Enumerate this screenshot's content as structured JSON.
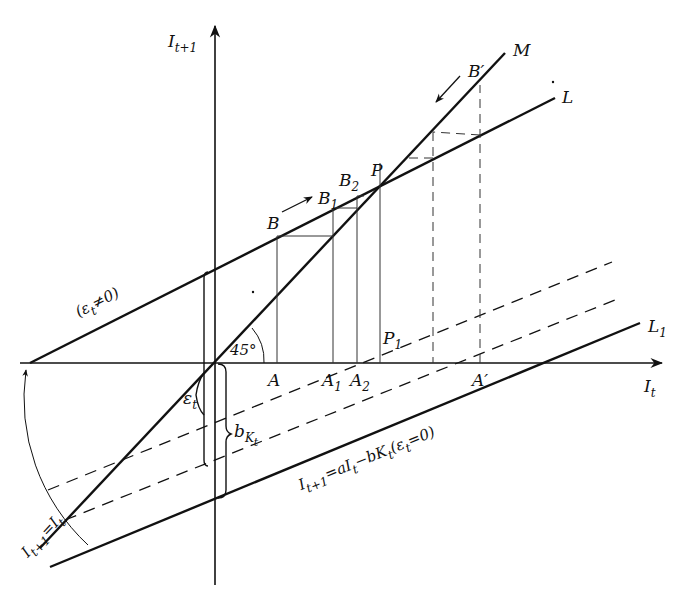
{
  "figure": {
    "type": "cobweb-diagram",
    "axes": {
      "y_label": "I",
      "y_label_sub": "t+1",
      "x_label": "I",
      "x_label_sub": "t"
    },
    "lines": {
      "M": "M",
      "L": "L",
      "L1": "L",
      "L1_sub": "1"
    },
    "points": {
      "B": "B",
      "B1": "B",
      "B1_sub": "1",
      "B2": "B",
      "B2_sub": "2",
      "P": "P",
      "B_prime": "B′",
      "A": "A",
      "A1": "A",
      "A1_sub": "1",
      "A2": "A",
      "A2_sub": "2",
      "A_prime": "A′",
      "P1": "P",
      "P1_sub": "1"
    },
    "annotations": {
      "angle": "45°",
      "epsilon_nonzero": "(ε",
      "epsilon_nonzero_sub": "t",
      "epsilon_nonzero_rest": "≠0)",
      "epsilon_t": "ε",
      "epsilon_t_sub": "t",
      "b_k": "b",
      "b_k_sub": "K",
      "b_k_subsub": "t",
      "equation": "I",
      "equation_sub1": "t+1",
      "equation_mid": "=aI",
      "equation_sub2": "t",
      "equation_mid2": "−bK",
      "equation_sub3": "t",
      "equation_end": "(ε",
      "equation_sub4": "t",
      "equation_tail": "=0)",
      "rotation_label": "I",
      "rotation_sub1": "t+1",
      "rotation_mid": "=I",
      "rotation_sub2": "t"
    },
    "colors": {
      "ink": "#111111",
      "background": "#ffffff"
    }
  }
}
